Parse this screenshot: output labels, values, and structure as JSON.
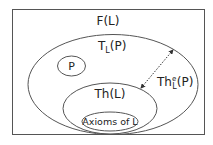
{
  "diagram": {
    "outer_box": {
      "label": "F(L)"
    },
    "big_ellipse": {
      "label_main": "T",
      "label_sub": "L",
      "label_tail": "(P)"
    },
    "p_ellipse": {
      "label": "P"
    },
    "theory_ellipse": {
      "label": "Th(L)"
    },
    "axioms_ellipse": {
      "label": "Axioms of L"
    },
    "gap_arrow": {
      "label_main": "Th",
      "label_sub": "L",
      "label_sup": "e",
      "label_tail": "(P)"
    }
  },
  "colors": {
    "stroke": "#555555",
    "text": "#222222",
    "background": "#ffffff"
  }
}
